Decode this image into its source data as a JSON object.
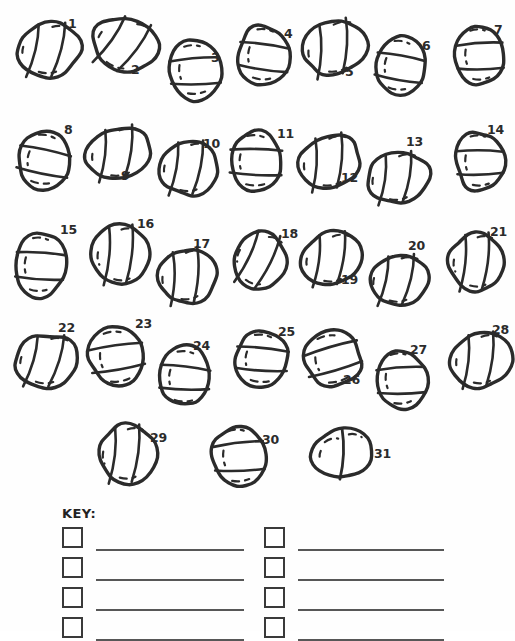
{
  "worksheet": {
    "title": "Numbered stone identification worksheet",
    "background_color": "#fefefe",
    "ink_color": "#2b2b2b",
    "line_color": "#575757",
    "stone_count": 31
  },
  "stones": [
    {
      "id": 1,
      "label": "1",
      "x": 16,
      "y": 22,
      "w": 66,
      "h": 56,
      "rot": -8,
      "variant": "diagonal-two",
      "num_x": 68,
      "num_y": 18
    },
    {
      "id": 2,
      "label": "2",
      "x": 91,
      "y": 16,
      "w": 68,
      "h": 58,
      "rot": 14,
      "variant": "diagonal-two",
      "num_x": 131,
      "num_y": 64
    },
    {
      "id": 3,
      "label": "3",
      "x": 168,
      "y": 40,
      "w": 54,
      "h": 60,
      "rot": -4,
      "variant": "band-two",
      "num_x": 211,
      "num_y": 52
    },
    {
      "id": 4,
      "label": "4",
      "x": 237,
      "y": 24,
      "w": 54,
      "h": 62,
      "rot": 6,
      "variant": "band-two",
      "num_x": 284,
      "num_y": 28
    },
    {
      "id": 5,
      "label": "5",
      "x": 301,
      "y": 20,
      "w": 68,
      "h": 56,
      "rot": -20,
      "variant": "diagonal-two",
      "num_x": 345,
      "num_y": 66
    },
    {
      "id": 6,
      "label": "6",
      "x": 374,
      "y": 36,
      "w": 52,
      "h": 60,
      "rot": 8,
      "variant": "band-two",
      "num_x": 422,
      "num_y": 40
    },
    {
      "id": 7,
      "label": "7",
      "x": 455,
      "y": 24,
      "w": 50,
      "h": 62,
      "rot": -3,
      "variant": "band-two",
      "num_x": 494,
      "num_y": 24
    },
    {
      "id": 8,
      "label": "8",
      "x": 16,
      "y": 130,
      "w": 56,
      "h": 60,
      "rot": 10,
      "variant": "band-two",
      "num_x": 64,
      "num_y": 124
    },
    {
      "id": 9,
      "label": "9",
      "x": 85,
      "y": 126,
      "w": 68,
      "h": 54,
      "rot": -16,
      "variant": "diagonal-two",
      "num_x": 121,
      "num_y": 170
    },
    {
      "id": 10,
      "label": "10",
      "x": 158,
      "y": 140,
      "w": 62,
      "h": 56,
      "rot": -10,
      "variant": "diagonal-two",
      "num_x": 203,
      "num_y": 138
    },
    {
      "id": 11,
      "label": "11",
      "x": 228,
      "y": 130,
      "w": 56,
      "h": 62,
      "rot": 2,
      "variant": "band-two",
      "num_x": 277,
      "num_y": 128
    },
    {
      "id": 12,
      "label": "12",
      "x": 297,
      "y": 134,
      "w": 66,
      "h": 56,
      "rot": -18,
      "variant": "diagonal-two",
      "num_x": 341,
      "num_y": 172
    },
    {
      "id": 13,
      "label": "13",
      "x": 366,
      "y": 152,
      "w": 64,
      "h": 52,
      "rot": -14,
      "variant": "diagonal-two",
      "num_x": 406,
      "num_y": 136
    },
    {
      "id": 14,
      "label": "14",
      "x": 455,
      "y": 130,
      "w": 50,
      "h": 62,
      "rot": -2,
      "variant": "band-two",
      "num_x": 487,
      "num_y": 124
    },
    {
      "id": 15,
      "label": "15",
      "x": 14,
      "y": 232,
      "w": 52,
      "h": 66,
      "rot": 4,
      "variant": "band-two",
      "num_x": 60,
      "num_y": 224
    },
    {
      "id": 16,
      "label": "16",
      "x": 92,
      "y": 224,
      "w": 58,
      "h": 62,
      "rot": -12,
      "variant": "diagonal-two",
      "num_x": 137,
      "num_y": 218
    },
    {
      "id": 17,
      "label": "17",
      "x": 156,
      "y": 248,
      "w": 62,
      "h": 56,
      "rot": -18,
      "variant": "diagonal-two",
      "num_x": 193,
      "num_y": 238
    },
    {
      "id": 18,
      "label": "18",
      "x": 232,
      "y": 230,
      "w": 56,
      "h": 60,
      "rot": 8,
      "variant": "diagonal-two",
      "num_x": 281,
      "num_y": 228
    },
    {
      "id": 19,
      "label": "19",
      "x": 300,
      "y": 232,
      "w": 64,
      "h": 54,
      "rot": -14,
      "variant": "diagonal-two",
      "num_x": 341,
      "num_y": 274
    },
    {
      "id": 20,
      "label": "20",
      "x": 367,
      "y": 254,
      "w": 64,
      "h": 52,
      "rot": -10,
      "variant": "diagonal-two",
      "num_x": 408,
      "num_y": 240
    },
    {
      "id": 21,
      "label": "21",
      "x": 448,
      "y": 232,
      "w": 58,
      "h": 60,
      "rot": -12,
      "variant": "diagonal-two",
      "num_x": 490,
      "num_y": 226
    },
    {
      "id": 22,
      "label": "22",
      "x": 14,
      "y": 334,
      "w": 66,
      "h": 54,
      "rot": -6,
      "variant": "diagonal-two",
      "num_x": 58,
      "num_y": 322
    },
    {
      "id": 23,
      "label": "23",
      "x": 88,
      "y": 326,
      "w": 58,
      "h": 62,
      "rot": -8,
      "variant": "band-two",
      "num_x": 135,
      "num_y": 318
    },
    {
      "id": 24,
      "label": "24",
      "x": 158,
      "y": 346,
      "w": 54,
      "h": 62,
      "rot": 4,
      "variant": "band-two",
      "num_x": 193,
      "num_y": 340
    },
    {
      "id": 25,
      "label": "25",
      "x": 234,
      "y": 330,
      "w": 56,
      "h": 58,
      "rot": 6,
      "variant": "band-two",
      "num_x": 278,
      "num_y": 326
    },
    {
      "id": 26,
      "label": "26",
      "x": 303,
      "y": 330,
      "w": 60,
      "h": 58,
      "rot": -14,
      "variant": "band-two",
      "num_x": 343,
      "num_y": 374
    },
    {
      "id": 27,
      "label": "27",
      "x": 375,
      "y": 348,
      "w": 52,
      "h": 62,
      "rot": -4,
      "variant": "band-two",
      "num_x": 410,
      "num_y": 344
    },
    {
      "id": 28,
      "label": "28",
      "x": 450,
      "y": 332,
      "w": 62,
      "h": 56,
      "rot": -14,
      "variant": "diagonal-two",
      "num_x": 492,
      "num_y": 324
    },
    {
      "id": 29,
      "label": "29",
      "x": 97,
      "y": 424,
      "w": 60,
      "h": 60,
      "rot": -12,
      "variant": "diagonal-two",
      "num_x": 150,
      "num_y": 432
    },
    {
      "id": 30,
      "label": "30",
      "x": 212,
      "y": 424,
      "w": 54,
      "h": 64,
      "rot": -4,
      "variant": "band-two",
      "num_x": 262,
      "num_y": 434
    },
    {
      "id": 31,
      "label": "31",
      "x": 310,
      "y": 428,
      "w": 62,
      "h": 52,
      "rot": -6,
      "variant": "diagonal-one",
      "num_x": 374,
      "num_y": 448
    }
  ],
  "key": {
    "title": "KEY:",
    "title_x": 62,
    "title_y": 506,
    "columns": [
      {
        "name": "left-column",
        "box_x": 62,
        "line_x": 96,
        "line_width": 148,
        "rows": [
          {
            "index": 1,
            "box_y": 527,
            "line_y": 549,
            "value": ""
          },
          {
            "index": 2,
            "box_y": 557,
            "line_y": 579,
            "value": ""
          },
          {
            "index": 3,
            "box_y": 587,
            "line_y": 609,
            "value": ""
          },
          {
            "index": 4,
            "box_y": 617,
            "line_y": 639,
            "value": ""
          }
        ]
      },
      {
        "name": "right-column",
        "box_x": 264,
        "line_x": 298,
        "line_width": 146,
        "rows": [
          {
            "index": 1,
            "box_y": 527,
            "line_y": 549,
            "value": ""
          },
          {
            "index": 2,
            "box_y": 557,
            "line_y": 579,
            "value": ""
          },
          {
            "index": 3,
            "box_y": 587,
            "line_y": 609,
            "value": ""
          },
          {
            "index": 4,
            "box_y": 617,
            "line_y": 639,
            "value": ""
          }
        ]
      }
    ]
  }
}
